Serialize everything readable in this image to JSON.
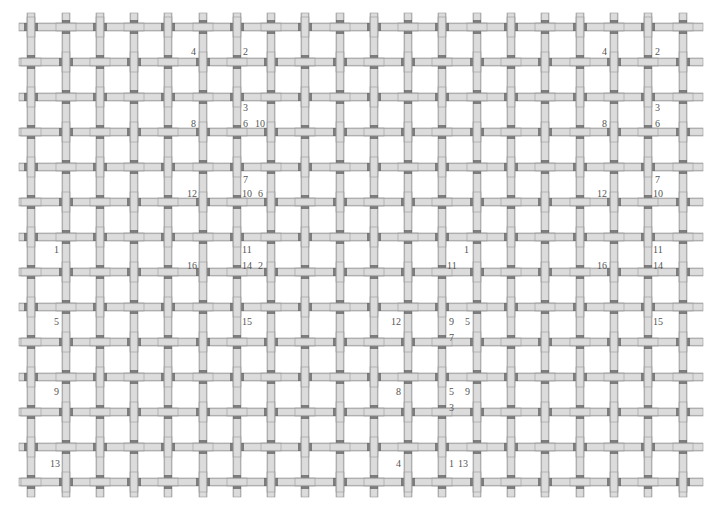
{
  "diagram": {
    "type": "plain-weave-grid",
    "background": "#ffffff",
    "strand_fill": "#d9d9d9",
    "strand_edge": "#9a9a9a",
    "strand_shadow": "#5e5e5e",
    "strand_width": 8,
    "columns_x": [
      31,
      66,
      100,
      134,
      168,
      203,
      237,
      271,
      305,
      340,
      374,
      408,
      442,
      477,
      511,
      545,
      580,
      614,
      648,
      683
    ],
    "rows_y": [
      27,
      62,
      97,
      132,
      167,
      202,
      237,
      272,
      307,
      342,
      377,
      412,
      447,
      482
    ],
    "extent": {
      "x_min": 19,
      "x_max": 703,
      "y_min": 13,
      "y_max": 497
    },
    "vertical_on_top_when": "row_plus_col_even"
  },
  "labels": [
    {
      "text": "4",
      "x": 191,
      "y": 47
    },
    {
      "text": "2",
      "x": 243,
      "y": 47
    },
    {
      "text": "3",
      "x": 243,
      "y": 103
    },
    {
      "text": "8",
      "x": 191,
      "y": 119
    },
    {
      "text": "6",
      "x": 243,
      "y": 119
    },
    {
      "text": "10",
      "x": 255,
      "y": 119
    },
    {
      "text": "7",
      "x": 243,
      "y": 175
    },
    {
      "text": "12",
      "x": 187,
      "y": 189
    },
    {
      "text": "10",
      "x": 242,
      "y": 189
    },
    {
      "text": "6",
      "x": 258,
      "y": 189
    },
    {
      "text": "1",
      "x": 54,
      "y": 245
    },
    {
      "text": "11",
      "x": 242,
      "y": 245
    },
    {
      "text": "16",
      "x": 187,
      "y": 261
    },
    {
      "text": "14",
      "x": 242,
      "y": 261
    },
    {
      "text": "2",
      "x": 258,
      "y": 261
    },
    {
      "text": "5",
      "x": 54,
      "y": 317
    },
    {
      "text": "15",
      "x": 242,
      "y": 317
    },
    {
      "text": "9",
      "x": 54,
      "y": 387
    },
    {
      "text": "13",
      "x": 50,
      "y": 459
    },
    {
      "text": "1",
      "x": 464,
      "y": 245
    },
    {
      "text": "11",
      "x": 447,
      "y": 261
    },
    {
      "text": "12",
      "x": 391,
      "y": 317
    },
    {
      "text": "9",
      "x": 449,
      "y": 317
    },
    {
      "text": "5",
      "x": 465,
      "y": 317
    },
    {
      "text": "7",
      "x": 449,
      "y": 333
    },
    {
      "text": "8",
      "x": 396,
      "y": 387
    },
    {
      "text": "5",
      "x": 449,
      "y": 387
    },
    {
      "text": "9",
      "x": 465,
      "y": 387
    },
    {
      "text": "3",
      "x": 449,
      "y": 403
    },
    {
      "text": "4",
      "x": 396,
      "y": 459
    },
    {
      "text": "1",
      "x": 449,
      "y": 459
    },
    {
      "text": "13",
      "x": 458,
      "y": 459
    },
    {
      "text": "4",
      "x": 602,
      "y": 47
    },
    {
      "text": "2",
      "x": 655,
      "y": 47
    },
    {
      "text": "3",
      "x": 655,
      "y": 103
    },
    {
      "text": "8",
      "x": 602,
      "y": 119
    },
    {
      "text": "6",
      "x": 655,
      "y": 119
    },
    {
      "text": "7",
      "x": 655,
      "y": 175
    },
    {
      "text": "12",
      "x": 597,
      "y": 189
    },
    {
      "text": "10",
      "x": 653,
      "y": 189
    },
    {
      "text": "11",
      "x": 653,
      "y": 245
    },
    {
      "text": "16",
      "x": 597,
      "y": 261
    },
    {
      "text": "14",
      "x": 653,
      "y": 261
    },
    {
      "text": "15",
      "x": 653,
      "y": 317
    }
  ]
}
